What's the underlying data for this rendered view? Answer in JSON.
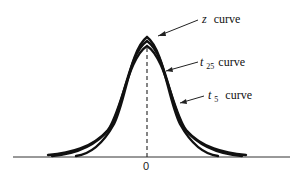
{
  "diagram": {
    "type": "distribution-comparison",
    "x_axis": {
      "center_tick_label": "0"
    },
    "curves": [
      {
        "id": "z",
        "symbol": "z",
        "subscript": "",
        "suffix": "curve",
        "peak_y": 37
      },
      {
        "id": "t25",
        "symbol": "t",
        "subscript": "25",
        "suffix": "curve",
        "peak_y": 41
      },
      {
        "id": "t5",
        "symbol": "t",
        "subscript": "5",
        "suffix": "curve",
        "peak_y": 46
      }
    ],
    "labels": {
      "z": {
        "symbol": "z",
        "text": "curve"
      },
      "t25": {
        "symbol": "t",
        "sub": "25",
        "text": "curve"
      },
      "t5": {
        "symbol": "t",
        "sub": "5",
        "text": "curve"
      }
    },
    "colors": {
      "ink": "#111111",
      "background": "#ffffff"
    }
  }
}
